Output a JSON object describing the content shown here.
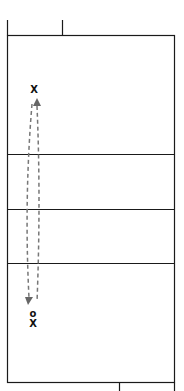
{
  "diagram": {
    "type": "volleyball-court-drill",
    "colors": {
      "lines": "#1a1a1a",
      "path": "#777777",
      "player": "#111111"
    },
    "players": [
      {
        "id": "player-top",
        "symbol": "X",
        "x": 34,
        "y": 93
      },
      {
        "id": "player-bottom-o",
        "symbol": "o",
        "x": 33,
        "y": 316
      },
      {
        "id": "player-bottom-x",
        "symbol": "X",
        "x": 33,
        "y": 326
      }
    ]
  }
}
